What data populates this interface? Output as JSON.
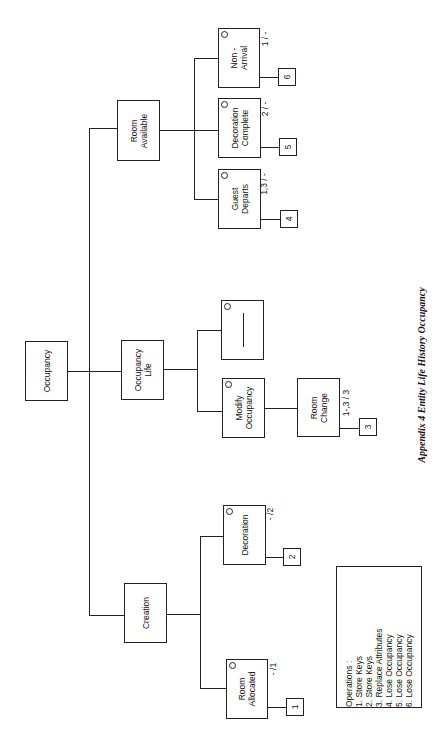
{
  "caption": "Appendix 4 Entity Life History  Occupancy",
  "nodes": {
    "root": "Occupancy",
    "creation": "Creation",
    "occupancy_life": "Occupancy\nLife",
    "room_available": "Room\nAvailable",
    "room_allocated": "Room\nAllocated",
    "decoration": "Decoration",
    "modify_occupancy": "Modify\nOccupancy",
    "blank": "",
    "room_change": "Room\nChange",
    "guest_departs": "Guest\nDeparts",
    "decoration_complete": "Decoration\nComplete",
    "non_arrival": "Non -\nArrival"
  },
  "state_labels": {
    "room_allocated": "- /1",
    "decoration": "- /2",
    "room_change": "1-,3 / 3",
    "guest_departs": "1,3 / -",
    "decoration_complete": "2 / -",
    "non_arrival": "1 / -"
  },
  "operation_boxes": [
    "1",
    "2",
    "3",
    "4",
    "5",
    "6"
  ],
  "legend": {
    "title": "Operations :",
    "items": [
      "1. Store Keys",
      "2. Store Keys",
      "3. Replace Attributes",
      "4. Lose Occupancy",
      "5. Lose Occupancy",
      "6. Lose Occupancy"
    ]
  }
}
